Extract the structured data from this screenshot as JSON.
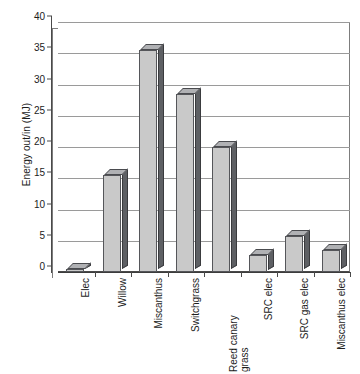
{
  "chart_data": {
    "type": "bar",
    "title": "",
    "subtitle": "",
    "xlabel": "",
    "ylabel": "Energy out/in (MJ)",
    "categories": [
      "Elec",
      "Willow",
      "Miscanthus",
      "Switchgrass",
      "Reed canary grass",
      "SRC elec",
      "SRC gas elec",
      "Miscanthus elec"
    ],
    "category_lines": [
      [
        "Elec"
      ],
      [
        "Willow"
      ],
      [
        "Miscanthus"
      ],
      [
        "Switchgrass"
      ],
      [
        "Reed canary",
        "grass"
      ],
      [
        "SRC elec"
      ],
      [
        "SRC gas elec"
      ],
      [
        "Miscanthus elec"
      ]
    ],
    "values": [
      0.5,
      15.5,
      35.5,
      28.5,
      20.0,
      2.8,
      5.7,
      3.5
    ],
    "ylim": [
      0,
      40
    ],
    "ytick_step": 5,
    "yticks": [
      0,
      5,
      10,
      15,
      20,
      25,
      30,
      35,
      40
    ],
    "ytick_labels": [
      "0",
      "5",
      "10",
      "15",
      "20",
      "25",
      "30",
      "35",
      "40"
    ],
    "grid": true,
    "grid_axis": "y",
    "legend": false,
    "legend_position": "none",
    "style": "3d-column",
    "series": [
      {
        "name": "Energy out/in",
        "values": [
          0.5,
          15.5,
          35.5,
          28.5,
          20.0,
          2.8,
          5.7,
          3.5
        ]
      }
    ]
  },
  "colors": {
    "bar_face": "#c9c9c9",
    "bar_side": "#5e6064",
    "bar_top": "#b0b1b4",
    "bar_outline": "#55565a",
    "gridline": "#9a9a9a",
    "axis": "#4a4a4a",
    "background": "#ffffff",
    "text": "#1c1c1c"
  }
}
